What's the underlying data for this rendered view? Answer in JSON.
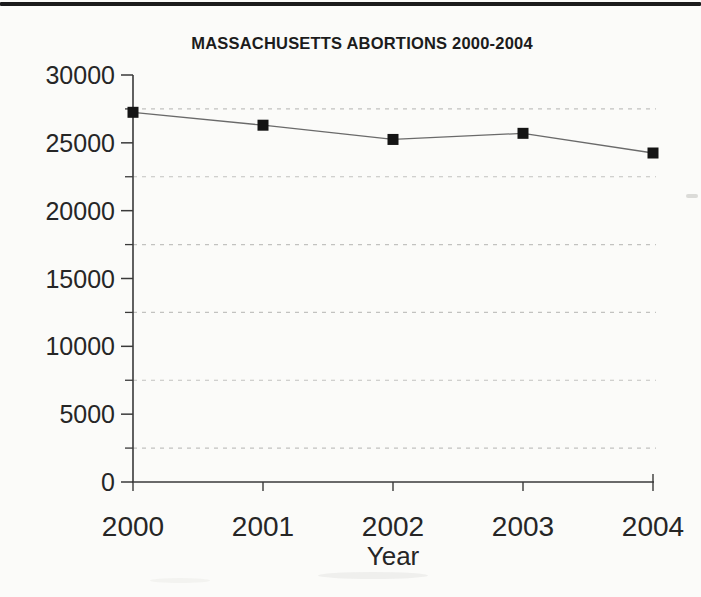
{
  "page": {
    "kind": "scanned book page with statistical chart",
    "background_color": "#fbfbf9",
    "top_rule_color": "#1b1b1b"
  },
  "chart_data": {
    "type": "line",
    "title": "MASSACHUSETTS ABORTIONS 2000-2004",
    "xlabel": "Year",
    "ylabel": "",
    "x": [
      2000,
      2001,
      2002,
      2003,
      2004
    ],
    "series": [
      {
        "name": "Abortions",
        "values": [
          27250,
          26300,
          25250,
          25700,
          24250
        ]
      }
    ],
    "ylim": [
      0,
      30000
    ],
    "y_ticks_major": [
      0,
      5000,
      10000,
      15000,
      20000,
      25000,
      30000
    ],
    "y_ticks_minor": [
      2500,
      7500,
      12500,
      17500,
      22500,
      27500
    ],
    "gridlines": "horizontal dashed at minor ticks only",
    "legend_position": "none",
    "marker_shape": "filled-square",
    "colors": {
      "line": "#6a6a6a",
      "marker": "#141414",
      "grid": "#c2c2c0",
      "axis": "#3a3a3a",
      "tick_label": "#262626",
      "title": "#1c1c1c"
    }
  }
}
